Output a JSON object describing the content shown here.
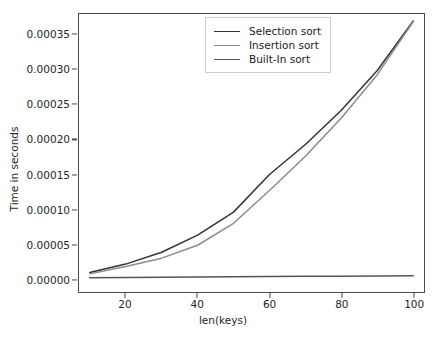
{
  "chart_data": {
    "type": "line",
    "title": "",
    "xlabel": "len(keys)",
    "ylabel": "Time in seconds",
    "xlim": [
      7,
      103
    ],
    "ylim": [
      -1.85e-05,
      0.00038
    ],
    "xticks": [
      20,
      40,
      60,
      80,
      100
    ],
    "xtick_labels": [
      "20",
      "40",
      "60",
      "80",
      "100"
    ],
    "yticks": [
      0.0,
      5e-05,
      0.0001,
      0.00015,
      0.0002,
      0.00025,
      0.0003,
      0.00035
    ],
    "ytick_labels": [
      "0.00000",
      "0.00005",
      "0.00010",
      "0.00015",
      "0.00020",
      "0.00025",
      "0.00030",
      "0.00035"
    ],
    "grid": false,
    "legend_position": "upper center",
    "x": [
      10,
      20,
      30,
      40,
      50,
      60,
      70,
      80,
      90,
      100
    ],
    "series": [
      {
        "name": "Selection sort",
        "color": "#333333",
        "values": [
          9.5e-06,
          2.15e-05,
          3.85e-05,
          6.3e-05,
          9.6e-05,
          0.00015,
          0.000193,
          0.000242,
          0.000299,
          0.00037
        ]
      },
      {
        "name": "Insertion sort",
        "color": "#8c8c8c",
        "values": [
          7.5e-06,
          1.8e-05,
          3e-05,
          4.85e-05,
          8e-05,
          0.000127,
          0.000176,
          0.000231,
          0.000293,
          0.000369
        ]
      },
      {
        "name": "Built-in sort",
        "color": "#555555",
        "values": [
          1.8e-06,
          2.2e-06,
          2.6e-06,
          3e-06,
          3.3e-06,
          3.6e-06,
          3.9e-06,
          4.2e-06,
          4.5e-06,
          4.8e-06
        ]
      }
    ]
  },
  "legend": {
    "entries": [
      {
        "label": "Selection sort"
      },
      {
        "label": "Insertion sort"
      },
      {
        "label": "Built-In sort"
      }
    ]
  },
  "colors": {
    "axis": "#4a4a4a",
    "text": "#262626",
    "background": "#ffffff",
    "legend_border": "#cccccc"
  }
}
